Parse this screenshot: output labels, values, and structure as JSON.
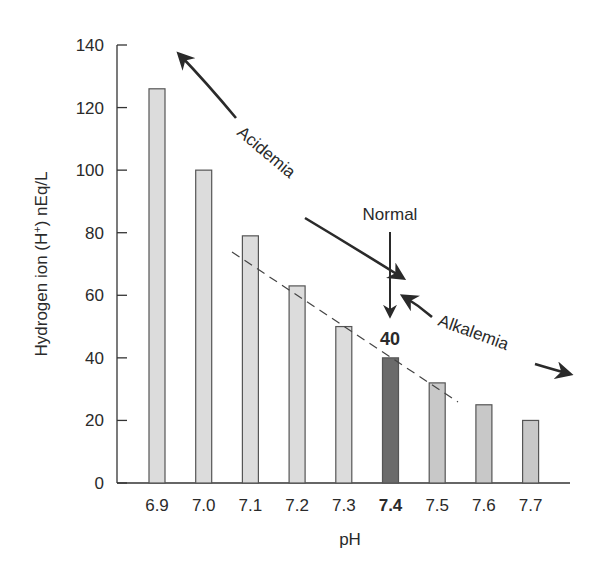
{
  "chart_data": {
    "type": "bar",
    "title": "",
    "xlabel": "pH",
    "ylabel": "Hydrogen ion (H+) nEq/L",
    "ylabel_parts": {
      "before": "Hydrogen ion (H",
      "sup": "+",
      "after": ") nEq/L"
    },
    "ylim": [
      0,
      140
    ],
    "yticks": [
      0,
      20,
      40,
      60,
      80,
      100,
      120,
      140
    ],
    "categories": [
      "6.9",
      "7.0",
      "7.1",
      "7.2",
      "7.3",
      "7.4",
      "7.5",
      "7.6",
      "7.7"
    ],
    "values": [
      126,
      100,
      79,
      63,
      50,
      40,
      32,
      25,
      20
    ],
    "highlight_index": 5,
    "highlight_label": "40",
    "grid": false,
    "legend": null,
    "colors": {
      "bar_acid": "#dcdcdc",
      "bar_normal": "#6b6b6b",
      "bar_alkaline": "#c8c8c8",
      "outline": "#555555",
      "axis": "#333333",
      "text": "#2a2a2a"
    },
    "annotations": [
      {
        "text": "Acidemia",
        "type": "curved-arrow",
        "direction": "both",
        "from": "6.9 high",
        "to": "7.4 normal"
      },
      {
        "text": "Normal",
        "type": "arrow",
        "direction": "down",
        "target": "7.4"
      },
      {
        "text": "Alkalemia",
        "type": "curved-arrow",
        "direction": "both",
        "from": "7.4 normal",
        "to": "7.7 low"
      },
      {
        "text": "",
        "type": "dashed-trendline",
        "from": "7.1",
        "to": "7.5"
      }
    ]
  }
}
